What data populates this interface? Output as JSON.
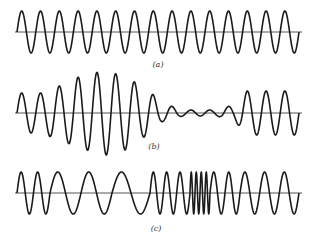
{
  "figure": {
    "background": "#ffffff",
    "line_color": "#1a1a1a",
    "axis_color": "#555555",
    "panels": [
      {
        "id": "a",
        "label": "(a)",
        "description": "constant-amplitude, constant-frequency carrier",
        "baseline_y": 32,
        "x_start": 15,
        "x_end": 302,
        "label_x": 158,
        "label_y": 60,
        "peaks_count": 15,
        "segments": [
          {
            "x0": 17,
            "x1": 299,
            "cycles": 15,
            "amp": 21
          }
        ]
      },
      {
        "id": "b",
        "label": "(b)",
        "description": "amplitude-modulated wave",
        "baseline_y": 113,
        "x_start": 15,
        "x_end": 302,
        "label_x": 154,
        "label_y": 142,
        "amplitude_envelope": [
          {
            "x": 17,
            "amp": 20
          },
          {
            "x": 40,
            "amp": 20
          },
          {
            "x": 60,
            "amp": 27
          },
          {
            "x": 80,
            "amp": 36
          },
          {
            "x": 105,
            "amp": 42
          },
          {
            "x": 125,
            "amp": 37
          },
          {
            "x": 145,
            "amp": 24
          },
          {
            "x": 165,
            "amp": 8
          },
          {
            "x": 185,
            "amp": 3
          },
          {
            "x": 215,
            "amp": 3
          },
          {
            "x": 232,
            "amp": 7
          },
          {
            "x": 248,
            "amp": 22
          },
          {
            "x": 262,
            "amp": 22
          },
          {
            "x": 299,
            "amp": 22
          }
        ],
        "segments": [
          {
            "x0": 17,
            "x1": 299,
            "cycles": 15
          }
        ]
      },
      {
        "id": "c",
        "label": "(c)",
        "description": "frequency-modulated wave",
        "baseline_y": 193,
        "x_start": 15,
        "x_end": 302,
        "label_x": 156,
        "label_y": 224,
        "amp": 21,
        "segments": [
          {
            "x0": 17,
            "x1": 50,
            "cycles": 2
          },
          {
            "x0": 50,
            "x1": 112,
            "cycles": 2
          },
          {
            "x0": 112,
            "x1": 150,
            "cycles": 1
          },
          {
            "x0": 150,
            "x1": 190,
            "cycles": 3
          },
          {
            "x0": 190,
            "x1": 210,
            "cycles": 4
          },
          {
            "x0": 210,
            "x1": 240,
            "cycles": 2
          },
          {
            "x0": 240,
            "x1": 299,
            "cycles": 3
          }
        ]
      }
    ]
  }
}
